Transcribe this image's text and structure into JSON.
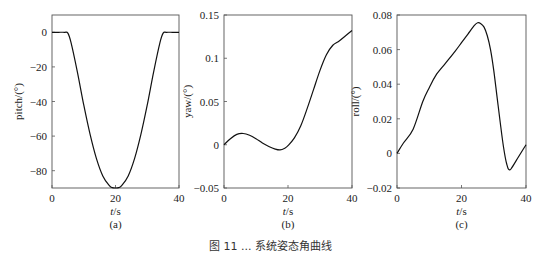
{
  "figure_caption": "图 11 ... 系统姿态角曲线",
  "chart_data": [
    {
      "type": "line",
      "panel_label": "(a)",
      "title": "",
      "xlabel": "t/s",
      "ylabel": "pitch/(°)",
      "xlim": [
        0,
        40
      ],
      "ylim": [
        -90,
        10
      ],
      "xticks": [
        0,
        20,
        40
      ],
      "yticks": [
        0,
        -20,
        -40,
        -60,
        -80
      ],
      "ytick_labels": [
        "0",
        "−20",
        "−40",
        "−60",
        "−80"
      ],
      "grid": false,
      "series": [
        {
          "name": "pitch",
          "x": [
            0,
            2,
            4,
            5,
            6,
            8,
            10,
            12,
            14,
            16,
            18,
            19,
            20,
            21,
            22,
            24,
            26,
            28,
            30,
            32,
            34,
            35,
            36,
            38,
            40
          ],
          "y": [
            0,
            0,
            0,
            -0.5,
            -6,
            -23,
            -42,
            -59,
            -73,
            -83,
            -88.5,
            -89.8,
            -90,
            -89.8,
            -88.5,
            -83,
            -73,
            -59,
            -42,
            -23,
            -6,
            -0.5,
            0,
            0,
            0
          ]
        }
      ]
    },
    {
      "type": "line",
      "panel_label": "(b)",
      "title": "",
      "xlabel": "t/s",
      "ylabel": "yaw/(°)",
      "xlim": [
        0,
        40
      ],
      "ylim": [
        -0.05,
        0.15
      ],
      "xticks": [
        0,
        20,
        40
      ],
      "yticks": [
        0.15,
        0.1,
        0.05,
        0,
        -0.05
      ],
      "ytick_labels": [
        "0.15",
        "0.1",
        "0.05",
        "0",
        "−0.05"
      ],
      "grid": false,
      "series": [
        {
          "name": "yaw",
          "x": [
            0,
            2,
            4,
            6,
            8,
            10,
            12,
            14,
            16,
            17.5,
            19,
            20,
            22,
            24,
            26,
            28,
            30,
            32,
            34,
            36,
            38,
            40
          ],
          "y": [
            0,
            0.007,
            0.012,
            0.013,
            0.011,
            0.007,
            0.002,
            -0.002,
            -0.005,
            -0.006,
            -0.004,
            -0.001,
            0.008,
            0.022,
            0.042,
            0.064,
            0.086,
            0.104,
            0.115,
            0.12,
            0.126,
            0.132
          ]
        }
      ]
    },
    {
      "type": "line",
      "panel_label": "(c)",
      "title": "",
      "xlabel": "t/s",
      "ylabel": "roll/(°)",
      "xlim": [
        0,
        40
      ],
      "ylim": [
        -0.02,
        0.08
      ],
      "xticks": [
        0,
        20,
        40
      ],
      "yticks": [
        0.08,
        0.06,
        0.04,
        0.02,
        0,
        -0.02
      ],
      "ytick_labels": [
        "0.08",
        "0.06",
        "0.04",
        "0.02",
        "0",
        "−0.02"
      ],
      "grid": false,
      "series": [
        {
          "name": "roll",
          "x": [
            0,
            2,
            5,
            8,
            10,
            12,
            15,
            18,
            20,
            22,
            24,
            25,
            26,
            27,
            28,
            29,
            30,
            31,
            32,
            33,
            34,
            35,
            37,
            40
          ],
          "y": [
            0,
            0.006,
            0.014,
            0.03,
            0.038,
            0.045,
            0.052,
            0.059,
            0.064,
            0.069,
            0.074,
            0.0755,
            0.075,
            0.073,
            0.068,
            0.06,
            0.048,
            0.033,
            0.018,
            0.004,
            -0.006,
            -0.0095,
            -0.004,
            0.005
          ]
        }
      ]
    }
  ]
}
